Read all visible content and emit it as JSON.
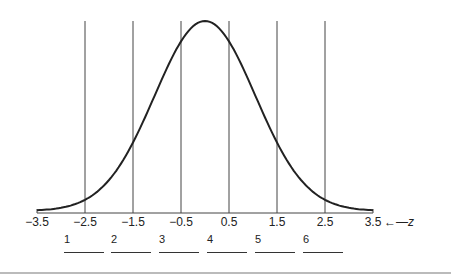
{
  "chart_data": {
    "type": "line",
    "title": "",
    "xlabel": "z",
    "x_ticks": [
      "-3.5",
      "-2.5",
      "-1.5",
      "-0.5",
      "0.5",
      "1.5",
      "2.5",
      "3.5"
    ],
    "xlim": [
      -3.5,
      3.5
    ],
    "vertical_lines_at": [
      -2.5,
      -1.5,
      -0.5,
      0.5,
      1.5,
      2.5
    ],
    "curve": "normal density, mean 0.2 approx, peak near z=0",
    "region_labels": [
      "1",
      "2",
      "3",
      "4",
      "5",
      "6"
    ]
  },
  "axis": {
    "ticks": [
      "−3.5",
      "−2.5",
      "−1.5",
      "−0.5",
      "0.5",
      "1.5",
      "2.5",
      "3.5"
    ],
    "z_arrow": "←",
    "z_label": "z"
  },
  "regions": [
    {
      "label": "1",
      "answer": ""
    },
    {
      "label": "2",
      "answer": ""
    },
    {
      "label": "3",
      "answer": ""
    },
    {
      "label": "4",
      "answer": ""
    },
    {
      "label": "5",
      "answer": ""
    },
    {
      "label": "6",
      "answer": ""
    }
  ]
}
